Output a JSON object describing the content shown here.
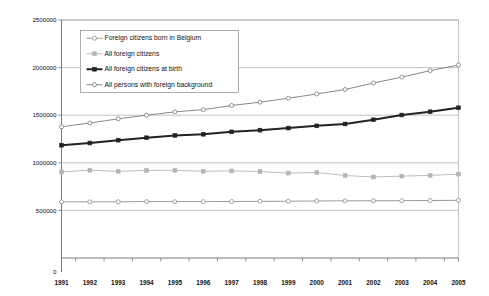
{
  "chart_data": {
    "type": "line",
    "title": "",
    "subtitle": "",
    "xlabel": "",
    "ylabel": "",
    "categories": [
      "1991",
      "1992",
      "1993",
      "1994",
      "1995",
      "1996",
      "1997",
      "1998",
      "1999",
      "2000",
      "2001",
      "2002",
      "2003",
      "2004",
      "2005"
    ],
    "x": [
      1991,
      1992,
      1993,
      1994,
      1995,
      1996,
      1997,
      1998,
      1999,
      2000,
      2001,
      2002,
      2003,
      2004,
      2005
    ],
    "ylim": [
      0,
      2500000
    ],
    "xlim": [
      1991,
      2005
    ],
    "y_ticks": [
      "0",
      "500000",
      "1000000",
      "1500000",
      "2000000",
      "2500000"
    ],
    "y_tick_values": [
      0,
      500000,
      1000000,
      1500000,
      2000000,
      2500000
    ],
    "grid": true,
    "grid_axis": "y",
    "legend_position": "upper-left-inside",
    "series": [
      {
        "name": "Foreign citizens born in Belgium",
        "color": "#8d8d8d",
        "marker": "open-circle",
        "line_style": "solid",
        "line_width": 0.9,
        "values": [
          590000,
          590000,
          591000,
          592000,
          592000,
          592000,
          594000,
          595000,
          596000,
          599000,
          600000,
          601000,
          602000,
          604000,
          606000
        ]
      },
      {
        "name": "All foreign citizens",
        "color": "#b4b4b4",
        "marker": "filled-square",
        "line_style": "solid",
        "line_width": 0.9,
        "values": [
          905000,
          922000,
          910000,
          920000,
          921000,
          911000,
          915000,
          908000,
          892000,
          898000,
          866000,
          851000,
          860000,
          868000,
          881000
        ]
      },
      {
        "name": "All foreign citizens at birth",
        "color": "#222222",
        "marker": "filled-square",
        "line_style": "solid",
        "line_width": 2.0,
        "values": [
          1185000,
          1208000,
          1238000,
          1263000,
          1288000,
          1300000,
          1325000,
          1343000,
          1365000,
          1388000,
          1408000,
          1452000,
          1502000,
          1536000,
          1578000
        ]
      },
      {
        "name": "All persons with foreign background",
        "color": "#7a7a7a",
        "marker": "open-circle",
        "line_style": "solid",
        "line_width": 0.9,
        "values": [
          1378000,
          1418000,
          1462000,
          1500000,
          1535000,
          1558000,
          1602000,
          1637000,
          1678000,
          1723000,
          1770000,
          1838000,
          1900000,
          1968000,
          2028000
        ]
      }
    ]
  }
}
